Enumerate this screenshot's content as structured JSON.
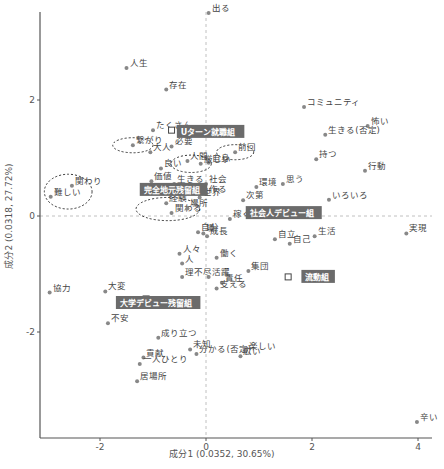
{
  "chart_data": {
    "type": "scatter",
    "title": "",
    "xlabel": "成分1 (0.0352, 30.65%)",
    "ylabel": "成分2 (0.0318, 27.72%)",
    "xlim": [
      -3.0,
      4.15
    ],
    "ylim": [
      -3.9,
      3.7
    ],
    "xticks": [
      -2,
      0,
      2,
      4
    ],
    "yticks": [
      -2,
      0,
      2
    ],
    "grid": false,
    "reference_lines": {
      "x0": true,
      "y0": true,
      "style": "dashed",
      "color": "#bbbbbb"
    },
    "point_color": "#888888",
    "group_label_bg": "#6b6b6b",
    "words": [
      {
        "label": "出る",
        "x": 0.05,
        "y": 3.5
      },
      {
        "label": "人生",
        "x": -1.5,
        "y": 2.55
      },
      {
        "label": "存在",
        "x": -0.75,
        "y": 2.18
      },
      {
        "label": "コミュニティ",
        "x": 1.85,
        "y": 1.88
      },
      {
        "label": "怖い",
        "x": 3.05,
        "y": 1.55
      },
      {
        "label": "生きる(否定)",
        "x": 2.25,
        "y": 1.4
      },
      {
        "label": "持つ",
        "x": 2.08,
        "y": 0.98
      },
      {
        "label": "行動",
        "x": 3.0,
        "y": 0.78
      },
      {
        "label": "たくさん",
        "x": -1.0,
        "y": 1.48
      },
      {
        "label": "繋がり",
        "x": -1.38,
        "y": 1.22
      },
      {
        "label": "大人",
        "x": -1.05,
        "y": 1.1
      },
      {
        "label": "必要",
        "x": -0.65,
        "y": 1.2
      },
      {
        "label": "前回",
        "x": 0.55,
        "y": 1.1
      },
      {
        "label": "人間",
        "x": -0.35,
        "y": 0.95
      },
      {
        "label": "自身",
        "x": 0.05,
        "y": 0.92
      },
      {
        "label": "良い",
        "x": -0.85,
        "y": 0.82
      },
      {
        "label": "厳しい",
        "x": -0.1,
        "y": 0.9
      },
      {
        "label": "価値",
        "x": -1.03,
        "y": 0.6
      },
      {
        "label": "生きる",
        "x": -0.6,
        "y": 0.55
      },
      {
        "label": "社会",
        "x": 0.0,
        "y": 0.55
      },
      {
        "label": "力",
        "x": -0.2,
        "y": 0.4
      },
      {
        "label": "作る",
        "x": 0.0,
        "y": 0.38
      },
      {
        "label": "世界",
        "x": -0.12,
        "y": 0.32
      },
      {
        "label": "環境",
        "x": 0.95,
        "y": 0.5
      },
      {
        "label": "思う",
        "x": 1.45,
        "y": 0.55
      },
      {
        "label": "次第",
        "x": 0.7,
        "y": 0.27
      },
      {
        "label": "関わり",
        "x": -2.53,
        "y": 0.52
      },
      {
        "label": "難しい",
        "x": -2.93,
        "y": 0.33
      },
      {
        "label": "経験",
        "x": -0.75,
        "y": 0.22
      },
      {
        "label": "関わる",
        "x": -0.65,
        "y": 0.05
      },
      {
        "label": "場所",
        "x": -0.35,
        "y": 0.13
      },
      {
        "label": "いろいろ",
        "x": 2.32,
        "y": 0.28
      },
      {
        "label": "稼ぐ",
        "x": 0.45,
        "y": -0.05
      },
      {
        "label": "生活",
        "x": 2.05,
        "y": -0.35
      },
      {
        "label": "自立",
        "x": 1.3,
        "y": -0.4
      },
      {
        "label": "自己",
        "x": 1.58,
        "y": -0.48
      },
      {
        "label": "実現",
        "x": 3.78,
        "y": -0.3
      },
      {
        "label": "自分",
        "x": -0.15,
        "y": -0.28
      },
      {
        "label": "場",
        "x": -0.05,
        "y": -0.3
      },
      {
        "label": "成長",
        "x": 0.02,
        "y": -0.35
      },
      {
        "label": "人々",
        "x": -0.5,
        "y": -0.65
      },
      {
        "label": "人",
        "x": -0.45,
        "y": -0.82
      },
      {
        "label": "働く",
        "x": 0.2,
        "y": -0.72
      },
      {
        "label": "理不尽",
        "x": -0.45,
        "y": -1.05
      },
      {
        "label": "活躍",
        "x": 0.05,
        "y": -1.05
      },
      {
        "label": "集団",
        "x": 0.8,
        "y": -0.95
      },
      {
        "label": "責任",
        "x": 0.3,
        "y": -1.15
      },
      {
        "label": "支える",
        "x": 0.2,
        "y": -1.25
      },
      {
        "label": "協力",
        "x": -2.95,
        "y": -1.32
      },
      {
        "label": "大変",
        "x": -1.9,
        "y": -1.3
      },
      {
        "label": "不安",
        "x": -1.85,
        "y": -1.85
      },
      {
        "label": "成り立つ",
        "x": -0.9,
        "y": -2.1
      },
      {
        "label": "未知",
        "x": -0.3,
        "y": -2.3
      },
      {
        "label": "分かる(否定)",
        "x": -0.18,
        "y": -2.38
      },
      {
        "label": "楽しい",
        "x": 0.75,
        "y": -2.32
      },
      {
        "label": "広い",
        "x": 0.65,
        "y": -2.42
      },
      {
        "label": "貢献",
        "x": -1.18,
        "y": -2.44
      },
      {
        "label": "一人ひとり",
        "x": -1.25,
        "y": -2.55
      },
      {
        "label": "居場所",
        "x": -1.3,
        "y": -2.85
      },
      {
        "label": "辛い",
        "x": 3.98,
        "y": -3.55
      }
    ],
    "groups": [
      {
        "label": "Uターン就職組",
        "x": -0.55,
        "y": 1.45,
        "bx": -0.65,
        "by": 1.48
      },
      {
        "label": "完全地元残留組",
        "x": -1.25,
        "y": 0.45,
        "bx": -0.1,
        "by": 0.42
      },
      {
        "label": "社会人デビュー組",
        "x": 0.75,
        "y": 0.05,
        "bx": 1.58,
        "by": 0.05
      },
      {
        "label": "流動組",
        "x": 1.8,
        "y": -1.05,
        "bx": 1.55,
        "by": -1.05
      },
      {
        "label": "大学デビュー残留組",
        "x": -1.7,
        "y": -1.5,
        "bx": -1.13,
        "by": -1.43
      }
    ],
    "ellipses": [
      {
        "cx": -1.38,
        "cy": 1.22,
        "rx": 0.38,
        "ry": 0.13
      },
      {
        "cx": 0.55,
        "cy": 1.1,
        "rx": 0.35,
        "ry": 0.13
      },
      {
        "cx": -0.28,
        "cy": 0.9,
        "rx": 0.38,
        "ry": 0.15
      },
      {
        "cx": -2.6,
        "cy": 0.42,
        "rx": 0.45,
        "ry": 0.3
      },
      {
        "cx": -0.72,
        "cy": 0.12,
        "rx": 0.6,
        "ry": 0.2
      }
    ]
  }
}
